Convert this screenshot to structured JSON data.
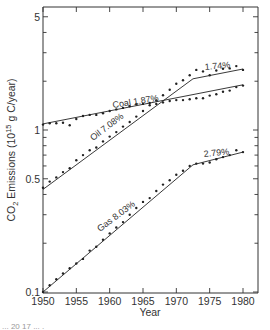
{
  "chart_data": {
    "type": "line",
    "title": "",
    "xlabel": "Year",
    "ylabel": "CO2 Emissions (10^15 g C/year)",
    "ylabel_parts": {
      "prefix": "CO",
      "sub": "2",
      "middle": " Emissions (10",
      "sup": "15",
      "suffix": " g  C/year)"
    },
    "yscale": "log",
    "xlim": [
      1950,
      1982
    ],
    "ylim": [
      0.1,
      5
    ],
    "x_ticks": [
      1950,
      1955,
      1960,
      1965,
      1970,
      1975,
      1980
    ],
    "x_tick_labels": [
      "1950",
      "1955",
      "1960",
      "1965",
      "1970",
      "1975",
      "1980"
    ],
    "y_tick_labels": [
      {
        "value": 0.1,
        "label": "0.1"
      },
      {
        "value": 0.5,
        "label": "0.5"
      },
      {
        "value": 1,
        "label": "1"
      },
      {
        "value": 5,
        "label": "5"
      }
    ],
    "grid": false,
    "legend": "none (inline labels)",
    "series": [
      {
        "name": "Coal",
        "label": "Coal 1.87%",
        "growth_rates": [
          "1.87%"
        ],
        "fit": [
          [
            1950,
            1.09
          ],
          [
            1980,
            1.9
          ]
        ],
        "points": [
          [
            1950,
            1.08
          ],
          [
            1951,
            1.1
          ],
          [
            1952,
            1.1
          ],
          [
            1953,
            1.11
          ],
          [
            1954,
            1.07
          ],
          [
            1955,
            1.17
          ],
          [
            1956,
            1.22
          ],
          [
            1957,
            1.24
          ],
          [
            1958,
            1.24
          ],
          [
            1959,
            1.27
          ],
          [
            1960,
            1.31
          ],
          [
            1961,
            1.34
          ],
          [
            1962,
            1.37
          ],
          [
            1963,
            1.4
          ],
          [
            1964,
            1.44
          ],
          [
            1965,
            1.45
          ],
          [
            1966,
            1.47
          ],
          [
            1967,
            1.45
          ],
          [
            1968,
            1.48
          ],
          [
            1969,
            1.51
          ],
          [
            1970,
            1.53
          ],
          [
            1971,
            1.53
          ],
          [
            1972,
            1.55
          ],
          [
            1973,
            1.57
          ],
          [
            1974,
            1.57
          ],
          [
            1975,
            1.63
          ],
          [
            1976,
            1.66
          ],
          [
            1977,
            1.72
          ],
          [
            1978,
            1.75
          ],
          [
            1979,
            1.84
          ],
          [
            1980,
            1.88
          ]
        ]
      },
      {
        "name": "Oil",
        "label": "Oil 7.08%",
        "growth_rates": [
          "7.08%",
          "1.74%"
        ],
        "fit": [
          [
            1950,
            0.43
          ],
          [
            1972.5,
            2.07
          ],
          [
            1980,
            2.38
          ]
        ],
        "points": [
          [
            1950,
            0.44
          ],
          [
            1951,
            0.48
          ],
          [
            1952,
            0.51
          ],
          [
            1953,
            0.55
          ],
          [
            1954,
            0.58
          ],
          [
            1955,
            0.65
          ],
          [
            1956,
            0.7
          ],
          [
            1957,
            0.75
          ],
          [
            1958,
            0.78
          ],
          [
            1959,
            0.85
          ],
          [
            1960,
            0.91
          ],
          [
            1961,
            0.97
          ],
          [
            1962,
            1.05
          ],
          [
            1963,
            1.12
          ],
          [
            1964,
            1.21
          ],
          [
            1965,
            1.31
          ],
          [
            1966,
            1.42
          ],
          [
            1967,
            1.52
          ],
          [
            1968,
            1.64
          ],
          [
            1969,
            1.77
          ],
          [
            1970,
            1.93
          ],
          [
            1971,
            2.03
          ],
          [
            1972,
            2.18
          ],
          [
            1973,
            2.35
          ],
          [
            1974,
            2.3
          ],
          [
            1975,
            2.18
          ],
          [
            1976,
            2.33
          ],
          [
            1977,
            2.39
          ],
          [
            1978,
            2.4
          ],
          [
            1979,
            2.48
          ],
          [
            1980,
            2.35
          ]
        ]
      },
      {
        "name": "Gas",
        "label": "Gas  8.03%",
        "growth_rates": [
          "8.03%",
          "2.79%"
        ],
        "fit": [
          [
            1950,
            0.1
          ],
          [
            1972.5,
            0.61
          ],
          [
            1980,
            0.73
          ]
        ],
        "points": [
          [
            1950,
            0.1
          ],
          [
            1951,
            0.11
          ],
          [
            1952,
            0.12
          ],
          [
            1953,
            0.13
          ],
          [
            1954,
            0.14
          ],
          [
            1955,
            0.15
          ],
          [
            1956,
            0.16
          ],
          [
            1957,
            0.18
          ],
          [
            1958,
            0.19
          ],
          [
            1959,
            0.21
          ],
          [
            1960,
            0.23
          ],
          [
            1961,
            0.25
          ],
          [
            1962,
            0.27
          ],
          [
            1963,
            0.3
          ],
          [
            1964,
            0.33
          ],
          [
            1965,
            0.36
          ],
          [
            1966,
            0.38
          ],
          [
            1967,
            0.42
          ],
          [
            1968,
            0.46
          ],
          [
            1969,
            0.49
          ],
          [
            1970,
            0.53
          ],
          [
            1971,
            0.56
          ],
          [
            1972,
            0.6
          ],
          [
            1973,
            0.62
          ],
          [
            1974,
            0.62
          ],
          [
            1975,
            0.63
          ],
          [
            1976,
            0.66
          ],
          [
            1977,
            0.68
          ],
          [
            1978,
            0.7
          ],
          [
            1979,
            0.75
          ],
          [
            1980,
            0.73
          ]
        ]
      }
    ],
    "annotations": [
      {
        "text": "Coal 1.87%",
        "series": "Coal"
      },
      {
        "text": "Oil 7.08%",
        "series": "Oil"
      },
      {
        "text": "1.74%",
        "series": "Oil"
      },
      {
        "text": "Gas  8.03%",
        "series": "Gas"
      },
      {
        "text": "2.79%",
        "series": "Gas"
      }
    ]
  },
  "caption_partial": "... 20 17 ... ."
}
